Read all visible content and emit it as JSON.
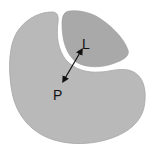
{
  "diagram": {
    "protein_label": "P",
    "ligand_label": "L",
    "colors": {
      "protein": "#b9b9b9",
      "ligand": "#a9a9a9",
      "outline": "#9a9a9a",
      "arrow": "#111111",
      "background": "#ffffff"
    }
  }
}
